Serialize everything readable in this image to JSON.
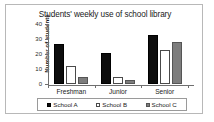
{
  "chart_data": {
    "type": "bar",
    "title": "Students' weekly use of school library",
    "xlabel": "",
    "ylabel": "Number of students",
    "categories": [
      "Freshman",
      "Junior",
      "Senior"
    ],
    "series": [
      {
        "name": "School A",
        "color": "#0d0d0d",
        "values": [
          27,
          21,
          33
        ]
      },
      {
        "name": "School B",
        "color": "#ffffff",
        "values": [
          12,
          5,
          23
        ]
      },
      {
        "name": "School C",
        "color": "#7d7d7d",
        "values": [
          5,
          3,
          28
        ]
      }
    ],
    "ylim": [
      0,
      40
    ],
    "yticks": [
      0,
      10,
      20,
      30,
      40
    ],
    "ytick_labels": [
      "0",
      "10",
      "20",
      "30",
      "40"
    ],
    "grid": false,
    "legend_position": "bottom"
  },
  "legend": {
    "items": [
      {
        "label": "School A"
      },
      {
        "label": "School B"
      },
      {
        "label": "School C"
      }
    ]
  }
}
